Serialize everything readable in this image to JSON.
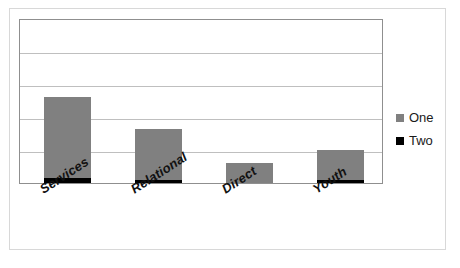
{
  "chart_data": {
    "type": "bar",
    "stacked": true,
    "title": "",
    "subtitle": "",
    "xlabel": "",
    "ylabel": "",
    "categories": [
      "Services",
      "Relational",
      "Direct",
      "Youth"
    ],
    "series": [
      {
        "name": "One",
        "color": "#808080",
        "values": [
          2.45,
          1.55,
          0.6,
          0.9
        ]
      },
      {
        "name": "Two",
        "color": "#000000",
        "values": [
          0.15,
          0.1,
          0.0,
          0.1
        ]
      }
    ],
    "totals": [
      2.6,
      1.65,
      0.6,
      1.0
    ],
    "ylim": [
      0,
      5
    ],
    "y_gridline_count": 5,
    "y_tick_labels": [],
    "grid": true,
    "legend_position": "right",
    "plot_border": true,
    "axis_tick_labels_visible": false
  },
  "legend": {
    "entries": [
      {
        "label": "One",
        "swatch": "gray-square-icon"
      },
      {
        "label": "Two",
        "swatch": "black-square-icon"
      }
    ]
  },
  "colors": {
    "series_one": "#808080",
    "series_two": "#000000",
    "gridline": "#bfbfbf",
    "plot_border": "#8f8f8f",
    "figure_border": "#d8d8d8",
    "background": "#ffffff",
    "label_text": "#111111"
  }
}
